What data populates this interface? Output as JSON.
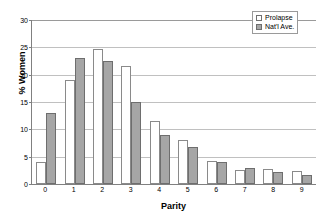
{
  "chart_data": {
    "type": "bar",
    "title": "",
    "xlabel": "Parity",
    "ylabel": "% Women",
    "categories": [
      "0",
      "1",
      "2",
      "3",
      "4",
      "5",
      "6",
      "7",
      "8",
      "9"
    ],
    "series": [
      {
        "name": "Prolapse",
        "color": "#ffffff",
        "values": [
          4.0,
          19.0,
          24.7,
          21.5,
          11.5,
          8.0,
          4.2,
          2.6,
          2.7,
          2.3
        ]
      },
      {
        "name": "Nat'l Ave.",
        "color": "#a6a6a6",
        "values": [
          13.0,
          23.0,
          22.5,
          15.0,
          9.0,
          6.8,
          4.0,
          3.0,
          2.2,
          1.7
        ]
      }
    ],
    "ylim": [
      0,
      30
    ],
    "yticks": [
      0,
      5,
      10,
      15,
      20,
      25,
      30
    ],
    "ytick_labels": [
      "0",
      "5",
      "10",
      "15",
      "20",
      "25",
      "30"
    ],
    "grid": true,
    "legend_position": "top-right"
  },
  "legend": {
    "items": [
      {
        "label": "Prolapse"
      },
      {
        "label": "Nat'l Ave."
      }
    ]
  }
}
